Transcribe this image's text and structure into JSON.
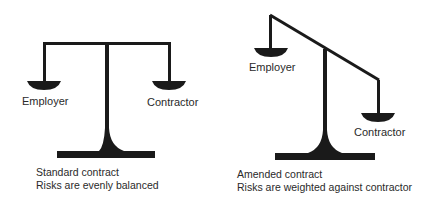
{
  "colors": {
    "ink": "#1a1a1a",
    "text": "#2a2a2a",
    "background": "#ffffff"
  },
  "left_scale": {
    "name": "standard-contract",
    "left_pan_label": "Employer",
    "right_pan_label": "Contractor",
    "caption_line1": "Standard contract",
    "caption_line2": "Risks are evenly balanced",
    "state": "balanced"
  },
  "right_scale": {
    "name": "amended-contract",
    "left_pan_label": "Employer",
    "right_pan_label": "Contractor",
    "caption_line1": "Amended contract",
    "caption_line2": "Risks are weighted against contractor",
    "state": "tilted-toward-contractor"
  }
}
